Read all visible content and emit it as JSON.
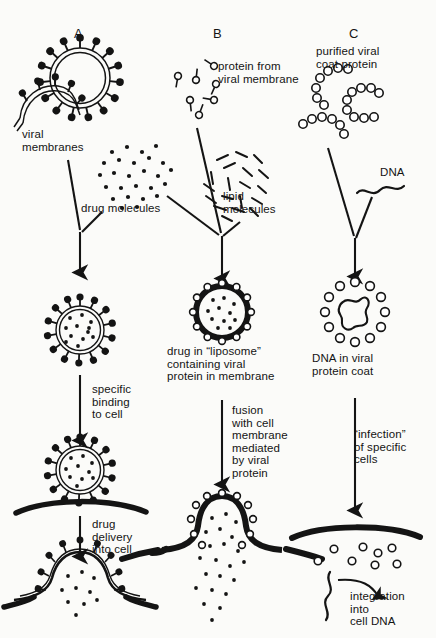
{
  "figure": {
    "type": "biology-schematic-diagram",
    "background_color": "#fbfbf9",
    "ink_color": "#141414",
    "columns": 3
  },
  "panels": [
    {
      "id": "A",
      "letter": "A",
      "start_label": "viral\nmembranes",
      "ingredient_label": "drug molecules",
      "product_label": "",
      "step1_label": "specific\nbinding\nto cell",
      "step2_label": "drug\ndelivery\ninto cell",
      "stages": [
        "enveloped virus membrane with spike proteins",
        "drug-loaded viral membrane vesicle",
        "vesicle bound to cell membrane",
        "drug released into cell"
      ]
    },
    {
      "id": "B",
      "letter": "B",
      "start_label": "protein from\nviral membrane",
      "ingredient_label": "lipid\nmolecules",
      "product_label": "drug in “liposome”\ncontaining viral\nprotein in membrane",
      "step1_label": "fusion\nwith cell\nmembrane\nmediated\nby viral\nprotein",
      "stages": [
        "purified viral membrane proteins",
        "lipid molecules",
        "drug-loaded liposome with viral protein",
        "liposome fused with cell membrane releasing drug"
      ]
    },
    {
      "id": "C",
      "letter": "C",
      "start_label": "purified viral\ncoat protein",
      "ingredient_label": "DNA",
      "product_label": "DNA in viral\nprotein coat",
      "step1_label": "“infection”\nof specific\ncells",
      "step2_label": "integration\ninto\ncell DNA",
      "stages": [
        "purified viral coat protein subunits",
        "DNA strand",
        "DNA packaged in viral protein coat",
        "coat proteins inside cell after infection"
      ]
    }
  ],
  "labels": {
    "a_letter": "A",
    "a_viral_membranes": "viral\nmembranes",
    "a_drug_molecules": "drug molecules",
    "a_specific_binding": "specific\nbinding\nto cell",
    "a_drug_delivery": "drug\ndelivery\ninto cell",
    "b_letter": "B",
    "b_protein_from": "protein from\nviral membrane",
    "b_lipid_molecules": "lipid\nmolecules",
    "b_drug_in_liposome": "drug in “liposome”\ncontaining viral\nprotein in membrane",
    "b_fusion": "fusion\nwith cell\nmembrane\nmediated\nby viral\nprotein",
    "c_letter": "C",
    "c_purified_coat": "purified viral\ncoat protein",
    "c_dna": "DNA",
    "c_dna_in_coat": "DNA in viral\nprotein coat",
    "c_infection": "“infection”\nof specific\ncells",
    "c_integration": "integration\ninto\ncell DNA"
  }
}
